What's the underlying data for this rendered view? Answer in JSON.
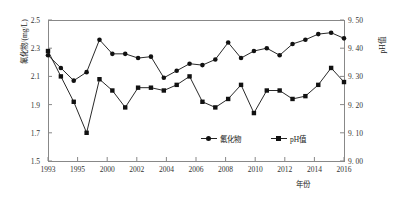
{
  "chart_data": {
    "type": "line",
    "title": "",
    "xlabel": "年份",
    "ylabel": "氟化物/(mg/L)",
    "ylabel_right": "pH值",
    "grid": false,
    "legend_position": "bottom-center",
    "x_tick_labels": [
      "1993",
      "1995",
      "2000",
      "2002",
      "2004",
      "2006",
      "2008",
      "2010",
      "2012",
      "2014",
      "2016"
    ],
    "ylim": [
      1.5,
      2.5
    ],
    "y_tick_labels": [
      "1.5",
      "1.7",
      "1.9",
      "2.1",
      "2.3",
      "2.5"
    ],
    "y_ticks": [
      1.5,
      1.7,
      1.9,
      2.1,
      2.3,
      2.5
    ],
    "ylim_right": [
      9.0,
      9.5
    ],
    "y_tick_labels_right": [
      "9. 00",
      "9. 10",
      "9. 20",
      "9. 30",
      "9. 40",
      "9. 50"
    ],
    "y_ticks_right": [
      9.0,
      9.1,
      9.2,
      9.3,
      9.4,
      9.5
    ],
    "x": [
      1993,
      1994,
      1995,
      1996,
      1997,
      1998,
      1999,
      2000,
      2001,
      2002,
      2003,
      2004,
      2005,
      2006,
      2007,
      2008,
      2009,
      2010,
      2011,
      2012,
      2013,
      2014,
      2015,
      2016
    ],
    "series": [
      {
        "name": "氟化物",
        "axis": "left",
        "marker": "circle",
        "color": "#111111",
        "values": [
          2.25,
          2.16,
          2.07,
          2.13,
          2.36,
          2.26,
          2.26,
          2.23,
          2.24,
          2.09,
          2.14,
          2.19,
          2.18,
          2.22,
          2.34,
          2.23,
          2.28,
          2.3,
          2.25,
          2.33,
          2.36,
          2.4,
          2.41,
          2.37
        ]
      },
      {
        "name": "pH值",
        "axis": "right",
        "marker": "square",
        "color": "#111111",
        "values": [
          9.39,
          9.3,
          9.21,
          9.1,
          9.29,
          9.25,
          9.19,
          9.26,
          9.26,
          9.25,
          9.27,
          9.3,
          9.21,
          9.19,
          9.22,
          9.27,
          9.17,
          9.25,
          9.25,
          9.22,
          9.23,
          9.27,
          9.33,
          9.28
        ]
      }
    ]
  }
}
